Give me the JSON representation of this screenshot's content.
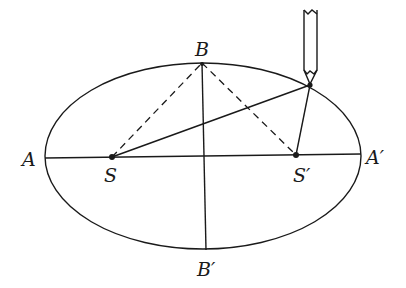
{
  "figure": {
    "labels": {
      "A": "A",
      "A_prime": "A′",
      "B": "B",
      "B_prime": "B′",
      "S": "S",
      "S_prime": "S′"
    },
    "colors": {
      "ink": "#1a1a1a",
      "background": "#ffffff"
    }
  },
  "geometry": {
    "ellipse": {
      "cx": 203,
      "cy": 156,
      "rx": 158,
      "ry": 93
    },
    "A": [
      45,
      158
    ],
    "A_prime": [
      361,
      154
    ],
    "B": [
      202,
      63
    ],
    "B_prime": [
      206,
      250
    ],
    "S": [
      112,
      157
    ],
    "S_prime": [
      296,
      155
    ],
    "pencil_tip": [
      310,
      85
    ]
  }
}
